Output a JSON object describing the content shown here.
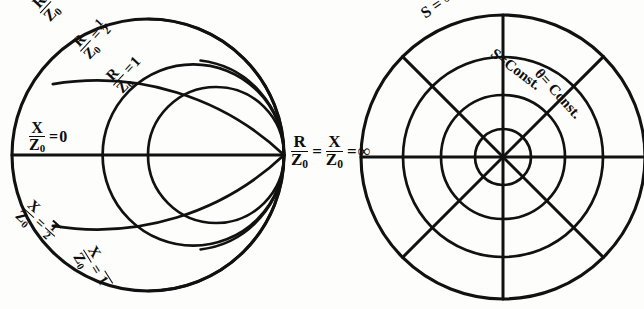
{
  "figure": {
    "type": "diagram",
    "background_color": "#fdfdfc",
    "ink_color": "#111111"
  },
  "left_chart": {
    "name": "impedance-chart",
    "center": {
      "x": 148,
      "y": 155
    },
    "radius": 136,
    "labels": {
      "r_zero": {
        "numerator": "R",
        "denominator": "Z",
        "sub": "0",
        "relation": "=",
        "value": "0",
        "rotation": -48,
        "x": 28,
        "y": 6
      },
      "r_half": {
        "numerator": "R",
        "denominator": "Z",
        "sub": "0",
        "relation": "=",
        "value": "1/2",
        "rotation": -48,
        "x": 68,
        "y": 44
      },
      "r_one": {
        "numerator": "R",
        "denominator": "Z",
        "sub": "0",
        "relation": "=",
        "value": "1",
        "rotation": -48,
        "x": 101,
        "y": 78
      },
      "x_zero": {
        "numerator": "X",
        "denominator": "Z",
        "sub": "0",
        "relation": "=",
        "value": "0",
        "rotation": 0,
        "x": 26,
        "y": 122
      },
      "x_neg_half": {
        "numerator": "X",
        "denominator": "Z",
        "sub": "0",
        "relation": "=",
        "value": "-1/2",
        "rotation": 42,
        "x": 32,
        "y": 196
      },
      "x_neg_one": {
        "numerator": "X",
        "denominator": "Z",
        "sub": "0",
        "relation": "=",
        "value": "-1",
        "rotation": 60,
        "x": 96,
        "y": 240
      },
      "infinity": {
        "first_num": "R",
        "first_den": "Z",
        "first_sub": "0",
        "relation_1": "=",
        "second_num": "X",
        "second_den": "Z",
        "second_sub": "0",
        "relation_2": "=",
        "value": "∞",
        "rotation": 0,
        "x": 288,
        "y": 133
      }
    },
    "curve_sets": {
      "resistance_circles": [
        {
          "label": "R/Z0 = 0",
          "value": 0
        },
        {
          "label": "R/Z0 = 1/2",
          "value": 0.5
        },
        {
          "label": "R/Z0 = 1",
          "value": 1
        }
      ],
      "reactance_arcs": [
        {
          "label": "X/Z0 = 0",
          "value": 0
        },
        {
          "label": "X/Z0 = -1/2",
          "value": -0.5
        },
        {
          "label": "X/Z0 = -1",
          "value": -1
        }
      ]
    }
  },
  "right_chart": {
    "name": "polar-chart",
    "center": {
      "x": 503,
      "y": 157
    },
    "radius": 142,
    "circle_radii": [
      142,
      100,
      62,
      28
    ],
    "radial_angles_deg": [
      0,
      45,
      90,
      135,
      180,
      225,
      270,
      315
    ],
    "labels": {
      "s_infinity": {
        "text": "S = ∞",
        "rotation": -36,
        "x": 418,
        "y": 6
      },
      "s_const": {
        "text": "S=Const.",
        "rotation": 37,
        "x": 498,
        "y": 47
      },
      "theta_const": {
        "text": "θ= Const.",
        "rotation": 48,
        "x": 542,
        "y": 67
      }
    }
  }
}
